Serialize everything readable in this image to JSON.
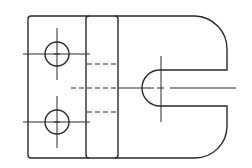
{
  "drawing": {
    "type": "orthographic-top-view",
    "description": "Technical drawing of a mounting block with two through-holes, a raised band with hidden edges, and a U-shaped slot on a rounded right end",
    "line_color": "#2a2a2a",
    "background": "#ffffff",
    "features": {
      "holes": [
        {
          "cx": 57,
          "cy": 54,
          "r": 12
        },
        {
          "cx": 57,
          "cy": 122,
          "r": 12
        }
      ],
      "slot": {
        "center_x": 160,
        "center_y": 88,
        "r": 18,
        "open_to": "right"
      },
      "band": {
        "x1": 86,
        "x2": 118
      },
      "hidden_lines": 3
    }
  }
}
